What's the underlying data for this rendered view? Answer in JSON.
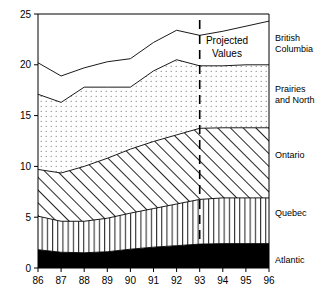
{
  "chart_data": {
    "type": "area",
    "stacked": true,
    "title": "",
    "subtitle": "",
    "xlabel": "",
    "ylabel": "",
    "x": [
      "86",
      "87",
      "88",
      "89",
      "90",
      "91",
      "92",
      "93",
      "94",
      "95",
      "96"
    ],
    "xlim": [
      86,
      96
    ],
    "ylim": [
      0,
      25
    ],
    "yticks": [
      0,
      5,
      10,
      15,
      20,
      25
    ],
    "ytick_labels": [
      "0",
      "5",
      "10",
      "15",
      "20",
      "25"
    ],
    "xtick_labels": [
      "86",
      "87",
      "88",
      "89",
      "90",
      "91",
      "92",
      "93",
      "94",
      "95",
      "96"
    ],
    "grid": false,
    "legend_position": "right-inline",
    "series": [
      {
        "name": "Atlantic",
        "fill": "solid-black",
        "color": "#000000",
        "values": [
          1.8,
          1.55,
          1.5,
          1.6,
          1.85,
          2.05,
          2.2,
          2.35,
          2.4,
          2.4,
          2.4
        ]
      },
      {
        "name": "Quebec",
        "fill": "vertical-lines",
        "color": "#ffffff",
        "values": [
          3.3,
          3.05,
          3.1,
          3.3,
          3.55,
          3.8,
          4.1,
          4.4,
          4.5,
          4.5,
          4.5
        ]
      },
      {
        "name": "Ontario",
        "fill": "diagonal-hatch",
        "color": "#ffffff",
        "values": [
          4.6,
          4.75,
          5.4,
          5.9,
          6.3,
          6.6,
          6.8,
          7.0,
          6.9,
          6.9,
          6.9
        ]
      },
      {
        "name": "Prairies and North",
        "fill": "dotted",
        "color": "#ffffff",
        "values": [
          7.4,
          6.95,
          7.8,
          7.0,
          6.1,
          6.95,
          7.4,
          6.15,
          6.1,
          6.2,
          6.2
        ]
      },
      {
        "name": "British Columbia",
        "fill": "white",
        "color": "#ffffff",
        "values": [
          3.1,
          2.6,
          1.9,
          2.5,
          2.8,
          2.8,
          2.9,
          3.0,
          3.4,
          3.8,
          4.3
        ]
      }
    ],
    "cumulative_tops": {
      "Atlantic": [
        1.8,
        1.55,
        1.5,
        1.6,
        1.85,
        2.05,
        2.2,
        2.35,
        2.4,
        2.4,
        2.4
      ],
      "Quebec": [
        5.1,
        4.6,
        4.6,
        4.9,
        5.4,
        5.85,
        6.3,
        6.75,
        6.9,
        6.9,
        6.9
      ],
      "Ontario": [
        9.7,
        9.35,
        10.0,
        10.8,
        11.7,
        12.45,
        13.1,
        13.75,
        13.8,
        13.8,
        13.8
      ],
      "Prairies and North": [
        17.1,
        16.3,
        17.8,
        17.8,
        17.8,
        19.4,
        20.5,
        19.9,
        19.9,
        20.0,
        20.0
      ],
      "British Columbia": [
        20.2,
        18.9,
        19.7,
        20.3,
        20.6,
        22.2,
        23.4,
        22.9,
        23.3,
        23.8,
        24.3
      ]
    },
    "annotations": [
      {
        "name": "projected-values",
        "text_line1": "Projected",
        "text_line2": "Values",
        "at_x": "93",
        "marker": "vertical-dashed-line"
      }
    ],
    "series_labels": [
      {
        "name": "British Columbia",
        "line1": "British",
        "line2": "Columbia"
      },
      {
        "name": "Prairies and North",
        "line1": "Prairies",
        "line2": "and North"
      },
      {
        "name": "Ontario",
        "line1": "Ontario",
        "line2": ""
      },
      {
        "name": "Quebec",
        "line1": "Quebec",
        "line2": ""
      },
      {
        "name": "Atlantic",
        "line1": "Atlantic",
        "line2": ""
      }
    ]
  }
}
